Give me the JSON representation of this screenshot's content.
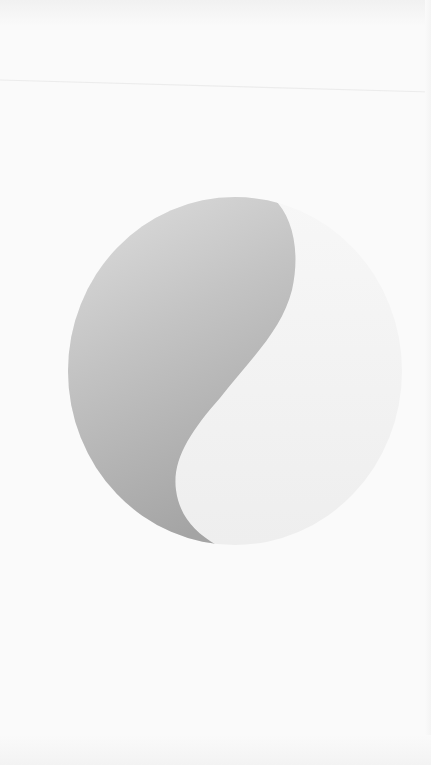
{
  "screen": {
    "type": "splash-screen",
    "background_color": "#fafafa"
  },
  "logo": {
    "icon": "yin-yang-logo-icon",
    "shape": "circle split by S-curve",
    "center": [
      235,
      371
    ],
    "radius_x": 167,
    "radius_y": 174,
    "colors": {
      "dark_half_top": "#dedede",
      "dark_half_bottom": "#a6a6a6",
      "light_half": "#f0f0f0"
    }
  },
  "divider": {
    "color": "#eeeeee"
  }
}
